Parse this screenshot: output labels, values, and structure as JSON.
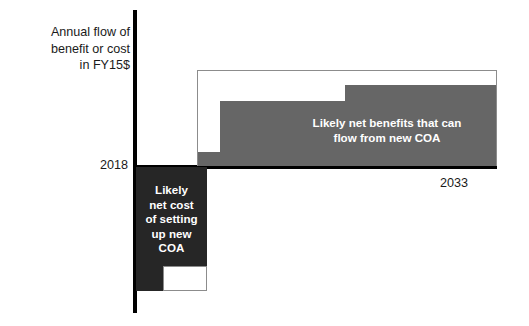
{
  "chart_data": {
    "type": "bar",
    "title": "",
    "subtitle": "",
    "ylabel": "Annual flow of\nbenefit or cost\nin FY15$",
    "xlabel": "",
    "grid": false,
    "legend_position": "none",
    "axis": {
      "x_tick_labels": [
        "2018",
        "2033"
      ],
      "x_range": [
        "2018",
        "2033"
      ],
      "y_zero_line": 0,
      "y_units": "FY15$ (unlabeled magnitude)"
    },
    "annotations": [
      {
        "name": "benefits-label",
        "text": "Likely net benefits that can\nflow from new COA",
        "color": "#ffffff"
      },
      {
        "name": "cost-label",
        "text": "Likely\nnet cost\nof setting\nup new\nCOA",
        "color": "#ffffff"
      }
    ],
    "series": [
      {
        "name": "Likely net benefits that can flow from new COA",
        "orientation": "above-baseline",
        "color": "#666666",
        "steps": [
          {
            "x_start": 2018.0,
            "x_end": 2019.2,
            "value": 15
          },
          {
            "x_start": 2019.2,
            "x_end": 2025.3,
            "value": 68
          },
          {
            "x_start": 2025.3,
            "x_end": 2033.0,
            "value": 84
          }
        ]
      },
      {
        "name": "Potential benefit envelope",
        "orientation": "above-baseline",
        "color": "#ffffff",
        "outline_color": "#8c8c8c",
        "steps": [
          {
            "x_start": 2018.0,
            "x_end": 2033.0,
            "value": 100
          }
        ]
      },
      {
        "name": "Likely net cost of setting up new COA",
        "orientation": "below-baseline",
        "color": "#262626",
        "steps": [
          {
            "x_start": 2018.0,
            "x_end": 2021.6,
            "value": -100
          }
        ],
        "cutout": {
          "x_start": 2019.4,
          "x_end": 2021.6,
          "value": -20,
          "color": "#ffffff"
        }
      }
    ]
  },
  "chart": {
    "y_axis_caption": "Annual flow of\nbenefit or cost\nin FY15$",
    "tick_start": "2018",
    "tick_end": "2033",
    "benefits_label": "Likely net benefits that can\nflow from new COA",
    "cost_label": "Likely\nnet cost\nof setting\nup new\nCOA",
    "colors": {
      "benefit_fill": "#666666",
      "cost_fill": "#262626",
      "envelope_outline": "#8c8c8c",
      "axis": "#000000",
      "text": "#1a1a1a",
      "label_text": "#ffffff",
      "background": "#ffffff"
    }
  }
}
